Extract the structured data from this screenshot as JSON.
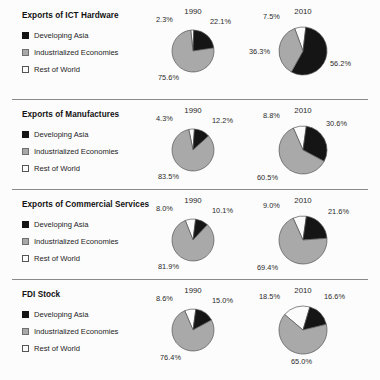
{
  "figure": {
    "background": "#fcfcfc",
    "colors": {
      "developing_asia": "#151515",
      "industrialized_economies": "#a9a9a9",
      "rest_of_world": "#fbfbfb",
      "outline": "#555555",
      "divider": "#8a8a8a",
      "text": "#1d1d1d"
    },
    "legend_labels": {
      "developing_asia": "Developing Asia",
      "industrialized_economies": "Industrialized Economies",
      "rest_of_world": "Rest of World"
    },
    "years": {
      "first": "1990",
      "second": "2010"
    }
  },
  "chart_data": [
    {
      "type": "pie",
      "title": "Exports of ICT Hardware",
      "legend": [
        "Developing Asia",
        "Industrialized Economies",
        "Rest of World"
      ],
      "legend_position": "left",
      "panels": [
        {
          "label": "1990",
          "categories": [
            "Rest of World",
            "Developing Asia",
            "Industrialized Economies"
          ],
          "values": [
            2.3,
            22.1,
            75.6
          ],
          "data_labels": [
            "2.3%",
            "22.1%",
            "75.6%"
          ],
          "radius": 21
        },
        {
          "label": "2010",
          "categories": [
            "Rest of World",
            "Developing Asia",
            "Industrialized Economies"
          ],
          "values": [
            7.5,
            56.2,
            36.3
          ],
          "data_labels": [
            "7.5%",
            "56.2%",
            "36.3%"
          ],
          "radius": 24
        }
      ]
    },
    {
      "type": "pie",
      "title": "Exports of Manufactures",
      "legend": [
        "Developing Asia",
        "Industrialized Economies",
        "Rest of World"
      ],
      "legend_position": "left",
      "panels": [
        {
          "label": "1990",
          "categories": [
            "Rest of World",
            "Developing Asia",
            "Industrialized Economies"
          ],
          "values": [
            4.3,
            12.2,
            83.5
          ],
          "data_labels": [
            "4.3%",
            "12.2%",
            "83.5%"
          ],
          "radius": 21
        },
        {
          "label": "2010",
          "categories": [
            "Rest of World",
            "Developing Asia",
            "Industrialized Economies"
          ],
          "values": [
            8.8,
            30.6,
            60.5
          ],
          "data_labels": [
            "8.8%",
            "30.6%",
            "60.5%"
          ],
          "radius": 24
        }
      ]
    },
    {
      "type": "pie",
      "title": "Exports of Commercial Services",
      "legend": [
        "Developing Asia",
        "Industrialized Economies",
        "Rest of World"
      ],
      "legend_position": "left",
      "panels": [
        {
          "label": "1990",
          "categories": [
            "Rest of World",
            "Developing Asia",
            "Industrialized Economies"
          ],
          "values": [
            8.0,
            10.1,
            81.9
          ],
          "data_labels": [
            "8.0%",
            "10.1%",
            "81.9%"
          ],
          "radius": 21
        },
        {
          "label": "2010",
          "categories": [
            "Rest of World",
            "Developing Asia",
            "Industrialized Economies"
          ],
          "values": [
            9.0,
            21.6,
            69.4
          ],
          "data_labels": [
            "9.0%",
            "21.6%",
            "69.4%"
          ],
          "radius": 24
        }
      ]
    },
    {
      "type": "pie",
      "title": "FDI Stock",
      "legend": [
        "Developing Asia",
        "Industrialized Economies",
        "Rest of World"
      ],
      "legend_position": "left",
      "panels": [
        {
          "label": "1990",
          "categories": [
            "Rest of World",
            "Developing Asia",
            "Industrialized Economies"
          ],
          "values": [
            8.6,
            15.0,
            76.4
          ],
          "data_labels": [
            "8.6%",
            "15.0%",
            "76.4%"
          ],
          "radius": 21
        },
        {
          "label": "2010",
          "categories": [
            "Rest of World",
            "Developing Asia",
            "Industrialized Economies"
          ],
          "values": [
            18.5,
            16.6,
            65.0
          ],
          "data_labels": [
            "18.5%",
            "16.6%",
            "65.0%"
          ],
          "radius": 24
        }
      ]
    }
  ]
}
